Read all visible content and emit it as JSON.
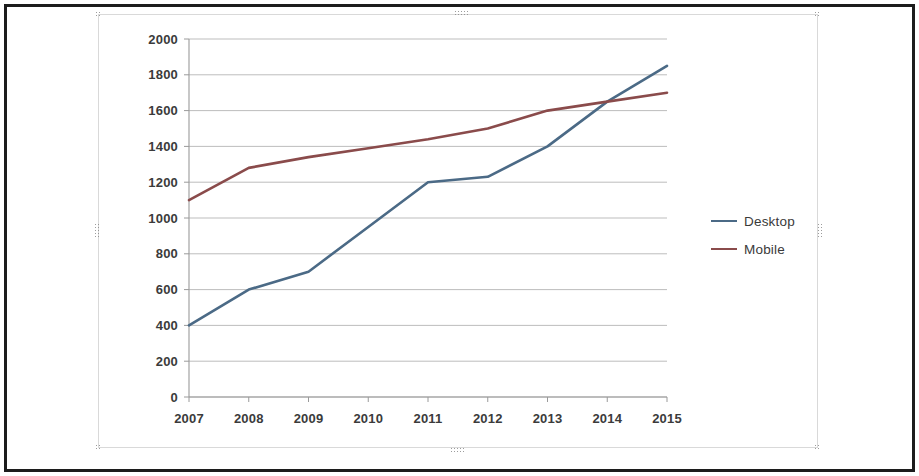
{
  "window": {
    "object_type": "embedded-chart-object",
    "selected": true
  },
  "legend": {
    "position": "right",
    "entries": [
      {
        "label": "Desktop",
        "color": "#4B6A86"
      },
      {
        "label": "Mobile",
        "color": "#8A4B4B"
      }
    ]
  },
  "axes": {
    "y_ticks": [
      "0",
      "200",
      "400",
      "600",
      "800",
      "1000",
      "1200",
      "1400",
      "1600",
      "1800",
      "2000"
    ],
    "x_ticks": [
      "2007",
      "2008",
      "2009",
      "2010",
      "2011",
      "2012",
      "2013",
      "2014",
      "2015"
    ]
  },
  "chart_data": {
    "type": "line",
    "title": "",
    "subtitle": "",
    "xlabel": "",
    "ylabel": "",
    "categories": [
      "2007",
      "2008",
      "2009",
      "2010",
      "2011",
      "2012",
      "2013",
      "2014",
      "2015"
    ],
    "series": [
      {
        "name": "Desktop",
        "color": "#4B6A86",
        "values": [
          400,
          600,
          700,
          950,
          1200,
          1230,
          1400,
          1650,
          1850
        ]
      },
      {
        "name": "Mobile",
        "color": "#8A4B4B",
        "values": [
          1100,
          1280,
          1340,
          1390,
          1440,
          1500,
          1600,
          1650,
          1700
        ]
      }
    ],
    "ylim": [
      0,
      2000
    ],
    "ytick_step": 200,
    "grid": true,
    "grid_axis": "y",
    "legend_position": "right",
    "markers": false
  }
}
